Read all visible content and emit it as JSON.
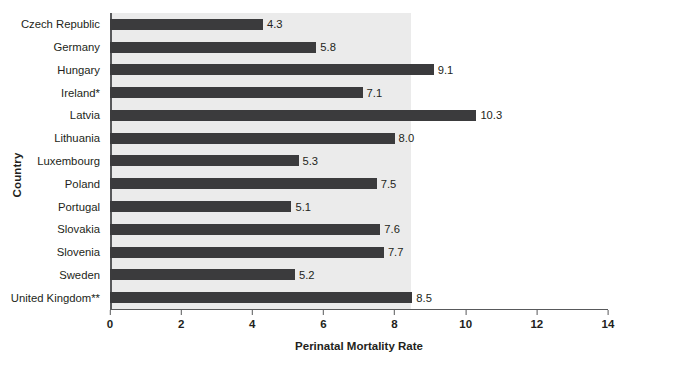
{
  "chart_data": {
    "type": "bar",
    "orientation": "horizontal",
    "title": "",
    "xlabel": "Perinatal Mortality Rate",
    "ylabel": "Country",
    "categories": [
      "Czech Republic",
      "Germany",
      "Hungary",
      "Ireland*",
      "Latvia",
      "Lithuania",
      "Luxembourg",
      "Poland",
      "Portugal",
      "Slovakia",
      "Slovenia",
      "Sweden",
      "United Kingdom**"
    ],
    "values": [
      4.3,
      5.8,
      9.1,
      7.1,
      10.3,
      8.0,
      5.3,
      7.5,
      5.1,
      7.6,
      7.7,
      5.2,
      8.5
    ],
    "value_labels": [
      "4.3",
      "5.8",
      "9.1",
      "7.1",
      "10.3",
      "8.0",
      "5.3",
      "7.5",
      "5.1",
      "7.6",
      "7.7",
      "5.2",
      "8.5"
    ],
    "xlim": [
      0,
      14
    ],
    "xticks": [
      0,
      2,
      4,
      6,
      8,
      10,
      12,
      14
    ],
    "xtick_labels": [
      "0",
      "2",
      "4",
      "6",
      "8",
      "10",
      "12",
      "14"
    ],
    "grid": false,
    "legend": null,
    "bar_color": "#3b3b3d",
    "plot_background": "#ebebeb",
    "axis_color": "#58595b",
    "text_color": "#231f20"
  }
}
